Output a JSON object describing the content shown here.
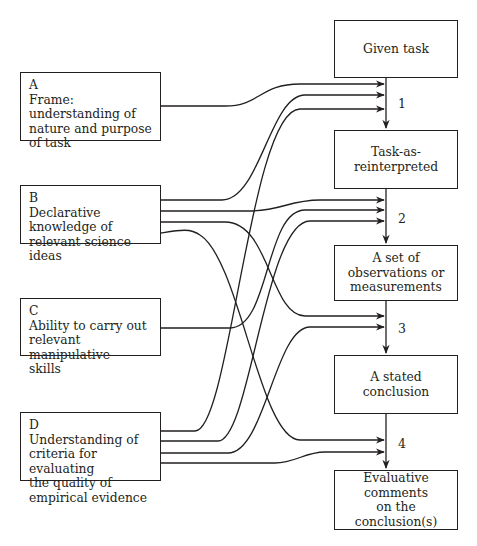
{
  "header": {
    "page_number": "92",
    "running_title": "LEARNING"
  },
  "left_boxes": [
    {
      "letter": "A",
      "text": "Frame: understanding of nature and purpose of task",
      "lines": [
        "Frame:",
        "understanding of",
        "nature and purpose",
        "of task"
      ]
    },
    {
      "letter": "B",
      "text": "Declarative knowledge of relevant science ideas",
      "lines": [
        "Declarative",
        "knowledge of",
        "relevant science ideas"
      ]
    },
    {
      "letter": "C",
      "text": "Ability to carry out relevant manipulative skills",
      "lines": [
        "Ability to carry out",
        "relevant manipulative",
        "skills"
      ]
    },
    {
      "letter": "D",
      "text": "Understanding of criteria for evaluating the quality of empirical evidence",
      "lines": [
        "Understanding of",
        "criteria for evaluating",
        "the quality of",
        "empirical evidence"
      ]
    }
  ],
  "right_boxes": [
    {
      "lines": [
        "Given task"
      ]
    },
    {
      "lines": [
        "Task-as-reinterpreted"
      ]
    },
    {
      "lines": [
        "A set of",
        "observations or",
        "measurements"
      ]
    },
    {
      "lines": [
        "A stated conclusion"
      ]
    },
    {
      "lines": [
        "Evaluative comments",
        "on the",
        "conclusion(s)"
      ]
    }
  ],
  "stages": [
    "1",
    "2",
    "3",
    "4"
  ],
  "connections": [
    {
      "from": "A",
      "to_stage": "1"
    },
    {
      "from": "B",
      "to_stage": "1"
    },
    {
      "from": "B",
      "to_stage": "2"
    },
    {
      "from": "B",
      "to_stage": "3"
    },
    {
      "from": "B",
      "to_stage": "4"
    },
    {
      "from": "C",
      "to_stage": "2"
    },
    {
      "from": "D",
      "to_stage": "1"
    },
    {
      "from": "D",
      "to_stage": "2"
    },
    {
      "from": "D",
      "to_stage": "3"
    },
    {
      "from": "D",
      "to_stage": "4"
    }
  ],
  "colors": {
    "line": "#231f20",
    "background": "#ffffff"
  }
}
